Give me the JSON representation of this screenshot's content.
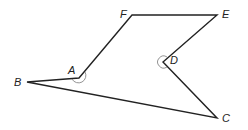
{
  "diagram": {
    "type": "concave hexagon",
    "colors": {
      "stroke": "#222222",
      "arc": "#888888",
      "background": "#ffffff"
    },
    "vertices": [
      {
        "id": "A",
        "label": "A",
        "x": 79,
        "y": 78,
        "lx": 68,
        "ly": 65,
        "reflex_arc": true
      },
      {
        "id": "B",
        "label": "B",
        "x": 27,
        "y": 82,
        "lx": 14,
        "ly": 77,
        "reflex_arc": false
      },
      {
        "id": "C",
        "label": "C",
        "x": 217,
        "y": 118,
        "lx": 222,
        "ly": 113,
        "reflex_arc": false
      },
      {
        "id": "D",
        "label": "D",
        "x": 163,
        "y": 62,
        "lx": 170,
        "ly": 55,
        "reflex_arc": true
      },
      {
        "id": "E",
        "label": "E",
        "x": 217,
        "y": 15,
        "lx": 222,
        "ly": 9,
        "reflex_arc": false
      },
      {
        "id": "F",
        "label": "F",
        "x": 132,
        "y": 15,
        "lx": 120,
        "ly": 9,
        "reflex_arc": false
      }
    ],
    "edges": [
      [
        "A",
        "F"
      ],
      [
        "F",
        "E"
      ],
      [
        "E",
        "D"
      ],
      [
        "D",
        "C"
      ],
      [
        "C",
        "B"
      ],
      [
        "B",
        "A"
      ]
    ]
  }
}
